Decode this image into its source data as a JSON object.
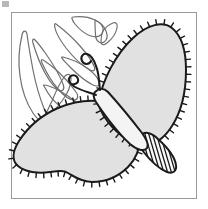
{
  "figure": {
    "title": "Butterfly Applique Quilting Pattern",
    "caption": "Line-art applique block: gray butterfly with blanket-stitched wing edges beside an outlined tulip and leaf spray",
    "width": 208,
    "height": 209,
    "background_color": "#ffffff"
  },
  "frame": {
    "name": "pattern block border",
    "x": 11,
    "y": 12,
    "width": 186,
    "height": 187,
    "stroke_color": "#9a9a9a",
    "stroke_width": 1,
    "fill_color": "#ffffff"
  },
  "artifact": {
    "label": "scan smudge",
    "x": 2,
    "y": 1,
    "width": 7,
    "height": 6,
    "color": "#7d7d7d"
  },
  "palette": {
    "outline": "#1b1b1b",
    "wing_fill": "#e1e1e1",
    "body_fill": "#f4f4f4",
    "motif_stroke": "#6f6f6f",
    "stitch": "#1b1b1b",
    "abdomen_fill": "#fafafa",
    "frame": "#9a9a9a",
    "paper": "#ffffff"
  },
  "elements": {
    "upper_right_wing": {
      "label": "Upper right wing",
      "fill": "#e1e1e1",
      "stroke": "#1b1b1b",
      "stroke_width": 2,
      "stitched": true,
      "path": "M 99 100 C 103 80 115 55 133 38 C 148 24 163 21 172 28 C 182 36 186 52 186 70 C 186 92 181 112 172 126 C 164 139 153 146 143 145 C 131 144 118 134 108 122 C 101 113 98 106 99 100 Z"
    },
    "lower_left_wing": {
      "label": "Lower left wing",
      "fill": "#e1e1e1",
      "stroke": "#1b1b1b",
      "stroke_width": 2,
      "stitched": true,
      "path": "M 99 101 C 88 100 72 102 58 108 C 42 115 28 127 19 141 C 12 152 12 161 18 166 C 25 172 38 174 50 172 C 58 171 63 170 68 173 C 75 177 82 182 92 182 C 106 182 119 176 128 167 C 136 159 140 148 140 137 C 140 124 133 114 123 108 C 114 103 106 101 99 101 Z"
    },
    "body": {
      "label": "Butterfly body / thorax",
      "fill": "#f4f4f4",
      "stroke": "#1b1b1b",
      "stroke_width": 2,
      "path": "M 95 92 C 99 88 104 88 108 92 C 118 103 132 120 142 133 C 147 140 149 145 147 148 C 144 152 137 150 130 144 C 118 133 103 113 96 102 C 93 97 93 94 95 92 Z"
    },
    "abdomen": {
      "label": "Striped abdomen",
      "fill": "#fafafa",
      "stroke": "#1b1b1b",
      "stroke_width": 2,
      "stripe_count": 9,
      "path": "M 140 136 C 144 131 151 132 158 139 C 168 148 175 158 176 165 C 177 171 173 174 167 172 C 159 169 149 159 142 150 C 137 143 137 139 140 136 Z"
    },
    "antennae": {
      "label": "Curled antennae",
      "stroke": "#1b1b1b",
      "stroke_width": 2,
      "left_path": "M 96 95 C 88 92 80 90 75 87 C 70 84 67 80 70 77 C 72 74 77 75 78 79 C 79 83 75 85 71 84",
      "right_path": "M 100 90 C 99 81 99 73 96 66 C 94 60 91 55 87 54 C 83 53 80 57 82 61 C 84 65 89 65 91 61"
    },
    "motif": {
      "label": "Tulip and leaf spray",
      "stroke": "#6f6f6f",
      "stroke_width": 1.2,
      "fill": "none",
      "paths": [
        "M 22 35 C 19 48 18 62 20 76 C 22 91 27 104 33 113 C 37 119 41 122 44 121 C 47 120 47 116 45 111 C 41 101 36 86 33 70 C 30 54 28 42 27 34 C 26 30 23 30 22 35 Z",
        "M 33 43 C 36 53 40 64 45 73 C 50 82 55 88 59 90 C 63 92 65 89 63 84 C 60 76 53 64 46 54 C 41 47 37 42 35 40 C 33 38 32 40 33 43 Z",
        "M 42 63 C 46 72 52 82 58 89 C 64 96 70 100 74 100 C 78 100 79 96 76 92 C 71 85 62 75 54 68 C 49 64 45 61 43 60 C 41 59 41 61 42 63 Z",
        "M 44 86 C 48 94 54 102 61 107 C 68 112 74 114 78 113 C 82 112 82 108 78 104 C 72 98 62 92 54 88 C 49 86 46 85 45 85 C 43 85 43 85 44 86 Z",
        "M 44 117 C 50 114 57 108 62 101 C 68 93 71 85 71 79 C 71 74 68 73 65 76 C 61 81 56 91 52 101 C 48 109 46 114 45 116 C 44 118 44 118 44 117 Z",
        "M 56 24 C 64 30 73 38 80 46 C 87 54 92 61 94 66 C 96 70 94 72 90 70 C 84 67 74 58 66 48 C 60 40 56 33 55 28 C 54 24 55 23 56 24 Z",
        "M 63 57 C 71 59 80 63 87 68 C 94 73 98 78 99 82 C 100 86 97 87 93 85 C 87 82 78 75 71 68 C 66 63 63 60 62 58 C 61 57 62 57 63 57 Z",
        "M 73 17 C 81 16 89 17 95 20 C 101 23 104 27 103 31 C 102 36 97 38 91 36 C 85 34 79 29 75 24 C 72 20 71 17 73 17 Z",
        "M 95 20 C 100 22 104 26 106 31 C 108 36 107 40 104 42 C 101 44 97 42 96 38 C 95 33 95 26 95 20 Z",
        "M 103 31 C 106 27 110 24 113 23 C 116 22 118 24 117 28 C 116 33 112 39 107 43 C 103 46 101 45 101 41 C 101 37 102 33 103 31 Z"
      ]
    }
  },
  "stitching": {
    "label": "Blanket stitch marks along wing edges",
    "tick_length": 5,
    "tick_width": 1.4,
    "color": "#1b1b1b",
    "upper_wing_tick_count": 44,
    "lower_wing_tick_count": 46
  }
}
